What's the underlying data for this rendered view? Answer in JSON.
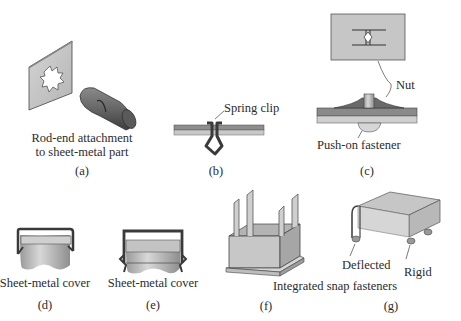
{
  "figure": {
    "panels": [
      {
        "id": "a",
        "caption": "(a)",
        "label_line1": "Rod-end attachment",
        "label_line2": "to sheet-metal part"
      },
      {
        "id": "b",
        "caption": "(b)",
        "callout": "Spring clip"
      },
      {
        "id": "c",
        "caption": "(c)",
        "callout_top": "Nut",
        "callout_bottom": "Push-on fastener"
      },
      {
        "id": "d",
        "caption": "(d)",
        "label": "Sheet-metal cover"
      },
      {
        "id": "e",
        "caption": "(e)",
        "label": "Sheet-metal cover"
      },
      {
        "id": "f",
        "caption": "(f)"
      },
      {
        "id": "g",
        "caption": "(g)",
        "callout_left": "Deflected",
        "callout_right": "Rigid"
      }
    ],
    "shared_label_fg": "Integrated snap fasteners"
  },
  "colors": {
    "sheet_light": "#c9c9c9",
    "sheet_dark": "#8f8f8f",
    "outline": "#3a3a3a",
    "metal_dark": "#555555",
    "text": "#2b2b2b"
  }
}
